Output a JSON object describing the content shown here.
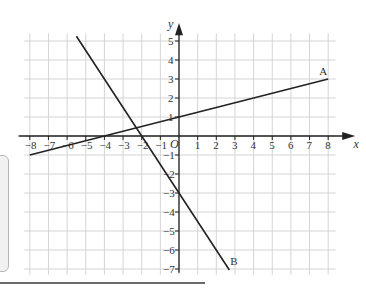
{
  "figure": {
    "x_axis_label": "x",
    "y_axis_label": "y",
    "origin_label": "O",
    "x_ticks": [
      -8,
      -7,
      -6,
      -5,
      -4,
      -3,
      -2,
      -1,
      1,
      2,
      3,
      4,
      5,
      6,
      7,
      8
    ],
    "y_ticks": [
      5,
      4,
      3,
      2,
      1,
      -1,
      -2,
      -3,
      -4,
      -5,
      -6,
      -7
    ],
    "lines": [
      {
        "label": "A",
        "equation": "y = 0.25x + 1",
        "start": [
          -8,
          -1
        ],
        "end": [
          8,
          3
        ]
      },
      {
        "label": "B",
        "equation": "y = -1.5x - 3",
        "start": [
          -5.5,
          5.25
        ],
        "end": [
          2.7,
          -7.05
        ]
      }
    ],
    "colors": {
      "grid": "#d4d4d4",
      "axis": "#222222",
      "line": "#222222"
    }
  }
}
